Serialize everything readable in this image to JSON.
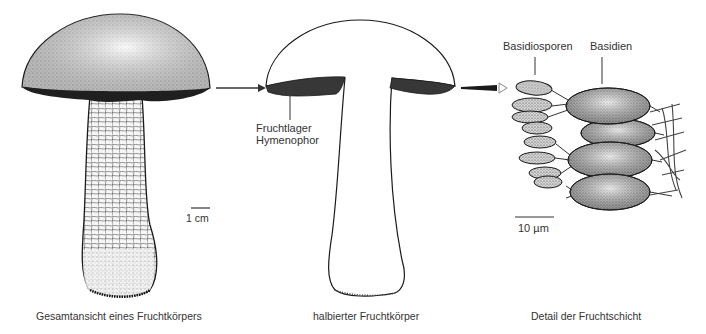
{
  "diagram": {
    "panels": [
      {
        "id": "whole",
        "caption": "Gesamtansicht eines Fruchtkörpers",
        "scale_bar": "1 cm"
      },
      {
        "id": "halved",
        "caption": "halbierter Fruchtkörper",
        "labels": [
          "Fruchtlager",
          "Hymenophor"
        ]
      },
      {
        "id": "detail",
        "caption": "Detail der Fruchtschicht",
        "labels": [
          "Basidiosporen",
          "Basidien"
        ],
        "scale_bar": "10 µm"
      }
    ],
    "colors": {
      "ink": "#1a1a1a",
      "text": "#333333",
      "background": "#ffffff"
    }
  }
}
